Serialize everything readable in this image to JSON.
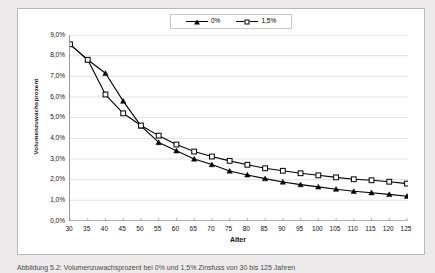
{
  "figure": {
    "caption": "Abbildung 5.2: Volumenzuwachsprozent bei 0% und 1,5% Zinsfuss von 30 bis 125 Jahren"
  },
  "legend": {
    "position": "top-center",
    "entries": [
      {
        "label": "0%",
        "marker": "filled-triangle",
        "color": "#000000"
      },
      {
        "label": "1,5%",
        "marker": "open-square",
        "color": "#000000"
      }
    ]
  },
  "axes": {
    "x": {
      "title": "Alter",
      "ticks": [
        "30",
        "35",
        "40",
        "45",
        "50",
        "55",
        "60",
        "65",
        "70",
        "75",
        "80",
        "85",
        "90",
        "95",
        "100",
        "105",
        "110",
        "115",
        "120",
        "125"
      ]
    },
    "y": {
      "title": "Volumenzuwachsprozent",
      "ticks": [
        "0,0%",
        "1,0%",
        "2,0%",
        "3,0%",
        "4,0%",
        "5,0%",
        "6,0%",
        "7,0%",
        "8,0%",
        "9,0%"
      ]
    }
  },
  "chart_data": {
    "type": "line",
    "title": "",
    "subtitle": "",
    "xlabel": "Alter",
    "ylabel": "Volumenzuwachsprozent",
    "categories": [
      30,
      35,
      40,
      45,
      50,
      55,
      60,
      65,
      70,
      75,
      80,
      85,
      90,
      95,
      100,
      105,
      110,
      115,
      120,
      125
    ],
    "x": [
      30,
      35,
      40,
      45,
      50,
      55,
      60,
      65,
      70,
      75,
      80,
      85,
      90,
      95,
      100,
      105,
      110,
      115,
      120,
      125
    ],
    "xlim": [
      30,
      125
    ],
    "ylim": [
      0.0,
      9.0
    ],
    "ytick_step": 1.0,
    "yunit": "%",
    "grid": "horizontal",
    "legend_position": "top-center",
    "series": [
      {
        "name": "0%",
        "marker": "filled-triangle",
        "color": "#000000",
        "values": [
          8.55,
          7.8,
          7.15,
          5.8,
          4.6,
          3.8,
          3.4,
          3.0,
          2.73,
          2.42,
          2.23,
          2.05,
          1.89,
          1.76,
          1.65,
          1.54,
          1.44,
          1.37,
          1.29,
          1.2
        ]
      },
      {
        "name": "1,5%",
        "marker": "open-square",
        "color": "#000000",
        "values": [
          8.55,
          7.8,
          6.12,
          5.21,
          4.62,
          4.13,
          3.7,
          3.36,
          3.12,
          2.91,
          2.72,
          2.55,
          2.43,
          2.31,
          2.21,
          2.11,
          2.02,
          1.97,
          1.9,
          1.81
        ]
      }
    ],
    "annotations": []
  },
  "colors": {
    "page_background": "#eceaea",
    "plot_background": "#ffffff",
    "frame_border": "#b9b9b9",
    "axis_line": "#9b9b9b",
    "gridline": "#d9d9d9",
    "series_line": "#000000"
  }
}
